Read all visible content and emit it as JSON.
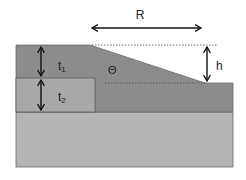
{
  "diagram": {
    "title": "",
    "labels": {
      "R": "R",
      "h": "h",
      "theta": "Θ",
      "t1_base": "t",
      "t1_sub": "1",
      "t2_base": "t",
      "t2_sub": "2"
    },
    "colors": {
      "background": "#ffffff",
      "top_layer": "#8c8c8c",
      "inner_block": "#a8a8a8",
      "substrate": "#b5b5b5",
      "outline": "#6a6a6a",
      "arrow": "#111111",
      "dotted": "#555555"
    },
    "layers": [
      {
        "name": "top-layer-with-slope",
        "description": "Dark layer with thickness t1 and a sloped step of height h over run R at angle Θ"
      },
      {
        "name": "inner-block",
        "description": "Lighter block of thickness t2 under the left portion of the top layer"
      },
      {
        "name": "substrate",
        "description": "Light-gray substrate at the bottom"
      }
    ],
    "dimensions": [
      {
        "name": "R",
        "description": "Horizontal run of the slope"
      },
      {
        "name": "h",
        "description": "Vertical step height"
      },
      {
        "name": "t1",
        "description": "Top layer thickness"
      },
      {
        "name": "t2",
        "description": "Inner block thickness"
      },
      {
        "name": "Θ",
        "description": "Slope angle"
      }
    ]
  }
}
